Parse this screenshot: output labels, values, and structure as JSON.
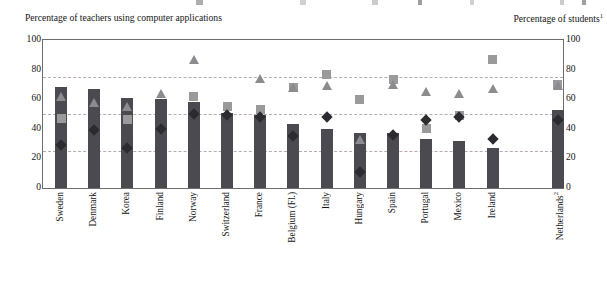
{
  "captions": {
    "left": "Percentage of teachers using computer applications",
    "right": "Percentage of students",
    "right_sup": "1"
  },
  "legend_clipped": {
    "note": "legend row cropped at top edge of image",
    "items": [
      "bar-series",
      "square-series",
      "triangle-series",
      "diamond-series"
    ]
  },
  "axis": {
    "left_ticks": [
      "100",
      "80",
      "60",
      "40",
      "20",
      "0"
    ],
    "right_ticks": [
      "100",
      "80",
      "60",
      "40",
      "20",
      "0"
    ]
  },
  "chart_data": {
    "type": "bar",
    "title": "",
    "subtitle": "",
    "xlabel": "",
    "ylabel": "Percentage of teachers using computer applications",
    "y2label": "Percentage of students",
    "ylim": [
      0,
      100
    ],
    "y2lim": [
      0,
      100
    ],
    "yticks": [
      0,
      20,
      40,
      60,
      80,
      100
    ],
    "grid": "horizontal dashed gridlines at 25, 50, 75",
    "gridlines": [
      25,
      50,
      75
    ],
    "legend": "top (cropped)",
    "categories": [
      "Sweden",
      "Denmark",
      "Korea",
      "Finland",
      "Norway",
      "Switzerland",
      "France",
      "Belgium (Fl.)",
      "Italy",
      "Hungary",
      "Spain",
      "Portugal",
      "Mexico",
      "Ireland",
      "Netherlands"
    ],
    "category_superscripts": {
      "Netherlands": "2"
    },
    "series": [
      {
        "name": "bar-series",
        "marker": "bar",
        "color": "#4a4a50",
        "values": [
          68,
          67,
          61,
          60,
          58,
          51,
          49,
          43,
          40,
          37,
          37,
          33,
          32,
          27,
          53
        ]
      },
      {
        "name": "square-series",
        "marker": "square",
        "color": "#9a9a9a",
        "values": [
          47,
          null,
          46,
          null,
          62,
          55,
          53,
          68,
          77,
          60,
          73,
          40,
          49,
          87,
          70
        ]
      },
      {
        "name": "triangle-series",
        "marker": "triangle",
        "color": "#8b8b90",
        "values": [
          62,
          58,
          55,
          64,
          87,
          null,
          74,
          68,
          69,
          33,
          70,
          65,
          64,
          67,
          69
        ]
      },
      {
        "name": "diamond-series",
        "marker": "diamond",
        "color": "#2b2b30",
        "values": [
          29,
          39,
          27,
          40,
          50,
          49,
          48,
          35,
          48,
          11,
          36,
          46,
          48,
          33,
          46
        ]
      }
    ]
  }
}
